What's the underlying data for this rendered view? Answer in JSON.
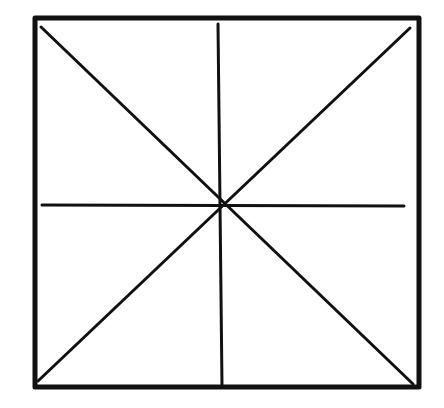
{
  "diagram": {
    "stroke_color": "#111111",
    "background_color": "#ffffff",
    "outer_square": {
      "x1": 35,
      "y1": 18,
      "x2": 419,
      "y2": 387,
      "stroke_width": 5
    },
    "lines": [
      {
        "name": "diagonal-top-left-to-bottom-right",
        "x1": 41,
        "y1": 27,
        "x2": 413,
        "y2": 384,
        "stroke_width": 3
      },
      {
        "name": "diagonal-top-right-to-bottom-left",
        "x1": 410,
        "y1": 28,
        "x2": 38,
        "y2": 381,
        "stroke_width": 3
      },
      {
        "name": "vertical-midline",
        "x1": 218,
        "y1": 24,
        "x2": 222,
        "y2": 386,
        "stroke_width": 3
      },
      {
        "name": "horizontal-midline",
        "x1": 42,
        "y1": 205,
        "x2": 404,
        "y2": 206,
        "stroke_width": 3
      }
    ],
    "center": {
      "x": 219,
      "y": 206
    }
  }
}
